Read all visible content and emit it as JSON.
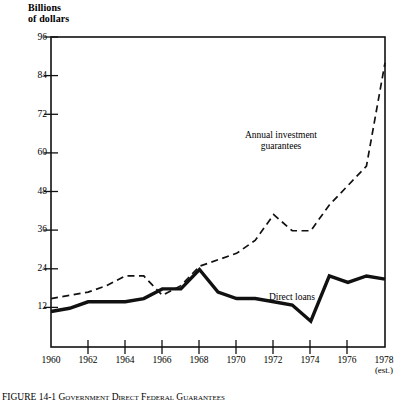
{
  "figure": {
    "y_axis_title": "Billions\nof dollars",
    "caption": "FIGURE 14-1   Government Direct Federal Guarantees"
  },
  "labels": {
    "guarantees": "Annual investment\nguarantees",
    "direct_loans": "Direct loans",
    "estimate_note": "(est.)"
  },
  "chart_data": {
    "type": "line",
    "title": "",
    "subtitle": "",
    "xlabel": "",
    "ylabel": "Billions of dollars",
    "xlim": [
      1960,
      1978
    ],
    "ylim": [
      0,
      96
    ],
    "ytick_values": [
      12,
      24,
      36,
      48,
      60,
      72,
      84,
      96
    ],
    "ytick_labels": [
      "12",
      "24",
      "36",
      "48",
      "60",
      "72",
      "84",
      "96"
    ],
    "xtick_values": [
      1960,
      1962,
      1964,
      1966,
      1968,
      1970,
      1972,
      1974,
      1976,
      1978
    ],
    "xtick_labels": [
      "1960",
      "1962",
      "1964",
      "1966",
      "1968",
      "1970",
      "1972",
      "1974",
      "1976",
      "1978"
    ],
    "xtick_sublabels": [
      "",
      "",
      "",
      "",
      "",
      "",
      "",
      "",
      "",
      "(est.)"
    ],
    "grid": false,
    "legend": "inline-annotations",
    "x": [
      1960,
      1961,
      1962,
      1963,
      1964,
      1965,
      1966,
      1967,
      1968,
      1969,
      1970,
      1971,
      1972,
      1973,
      1974,
      1975,
      1976,
      1977,
      1978
    ],
    "series": [
      {
        "name": "Annual investment guarantees",
        "style": "dashed",
        "color": "#111111",
        "values": [
          15,
          16,
          17,
          19,
          22,
          22,
          16,
          19,
          25,
          27,
          29,
          33,
          41,
          36,
          36,
          44,
          50,
          56,
          88
        ]
      },
      {
        "name": "Direct loans",
        "style": "solid",
        "color": "#111111",
        "values": [
          11,
          12,
          14,
          14,
          14,
          15,
          18,
          18,
          24,
          17,
          15,
          15,
          14,
          13,
          8,
          22,
          20,
          22,
          21
        ]
      }
    ]
  }
}
